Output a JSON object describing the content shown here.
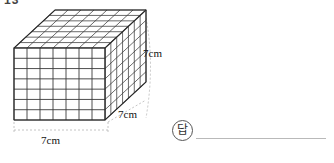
{
  "page": {
    "question_number": "13",
    "background_color": "#ffffff"
  },
  "figure": {
    "name": "cube-stack",
    "type": "oblique-projection-cube",
    "units_per_edge": 7,
    "front_face_grid": {
      "columns": 7,
      "rows": 7
    },
    "top_face_grid": {
      "columns": 7,
      "rows": 7
    },
    "side_face_grid": {
      "columns": 7,
      "rows": 7
    },
    "line_color": "#3a3a3a",
    "fill_color": "#ffffff",
    "guide_color": "#b0b0b0"
  },
  "labels": {
    "height": "7cm",
    "depth": "7cm",
    "width": "7cm"
  },
  "answer": {
    "marker": "답",
    "marker_icon": "circled-answer-icon",
    "value": "",
    "line_color": "#b9b9b9"
  }
}
